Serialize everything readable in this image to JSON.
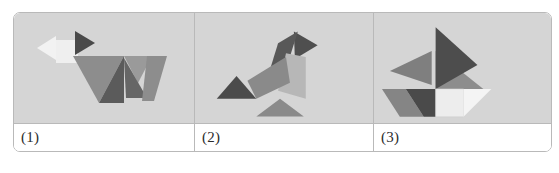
{
  "figure": {
    "kind": "tangram-figures-table",
    "background_color": "#ffffff",
    "panel_background_color": "#d5d5d5",
    "border_color": "#b9b9b9",
    "panels": [
      {
        "label": "(1)",
        "subject": "dog",
        "shapes": [
          {
            "name": "white-large-triangle",
            "color": "#f2f2f2",
            "points": "23,35 42,23 42,47"
          },
          {
            "name": "white-square",
            "color": "#efefef",
            "points": "42,27 64,27 64,50 42,50"
          },
          {
            "name": "dark-triangle-head",
            "color": "#4a4a4a",
            "points": "61,18 81,30 61,42"
          },
          {
            "name": "medium-gray-body-triangle",
            "color": "#8d8d8d",
            "points": "59,43 110,43 85,90"
          },
          {
            "name": "dark-gray-body-triangle",
            "color": "#5b5b5b",
            "points": "110,43 110,90 85,90"
          },
          {
            "name": "mid-gray-back-triangle",
            "color": "#9a9a9a",
            "points": "110,43 138,43 124,70"
          },
          {
            "name": "dark-leg-triangle",
            "color": "#666666",
            "points": "110,45 133,85 112,85"
          },
          {
            "name": "gray-hind-leg",
            "color": "#8d8d8d",
            "points": "133,43 153,43 140,88 128,88"
          }
        ]
      },
      {
        "label": "(2)",
        "subject": "leaping-figure",
        "shapes": [
          {
            "name": "dark-top-triangle",
            "color": "#4f4f4f",
            "points": "100,18 124,32 101,46"
          },
          {
            "name": "dark-neck-parallelogram",
            "color": "#585858",
            "points": "84,30 104,18 92,56 76,56"
          },
          {
            "name": "light-gray-quarter-round",
            "color": "#b7b7b7",
            "points": "92,40 112,44 112,86 84,78"
          },
          {
            "name": "mid-gray-body",
            "color": "#8a8a8a",
            "points": "53,68 92,44 96,70 62,86"
          },
          {
            "name": "dark-foot-triangle",
            "color": "#4b4b4b",
            "points": "22,86 42,63 62,86"
          },
          {
            "name": "gray-base-triangle",
            "color": "#8a8a8a",
            "points": "62,104 86,86 110,104"
          }
        ]
      },
      {
        "label": "(3)",
        "subject": "sailboat",
        "shapes": [
          {
            "name": "dark-large-sail-triangle",
            "color": "#4d4d4d",
            "points": "62,14 62,76 104,52"
          },
          {
            "name": "gray-right-sail-triangle",
            "color": "#8d8d8d",
            "points": "62,38 110,76 62,76"
          },
          {
            "name": "mid-gray-left-sail-triangle",
            "color": "#7f7f7f",
            "points": "16,58 58,38 58,72"
          },
          {
            "name": "gray-hull-parallelogram",
            "color": "#858585",
            "points": "8,76 32,76 50,104 26,104"
          },
          {
            "name": "dark-hull-triangle",
            "color": "#4a4a4a",
            "points": "32,76 62,76 62,104 50,104"
          },
          {
            "name": "white-hull-square",
            "color": "#ededed",
            "points": "62,76 90,76 90,104 62,104"
          },
          {
            "name": "white-hull-triangle",
            "color": "#f4f4f4",
            "points": "90,76 118,76 90,104"
          }
        ]
      }
    ]
  }
}
